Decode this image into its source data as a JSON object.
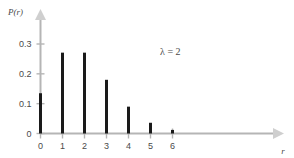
{
  "chart_data": {
    "type": "bar",
    "title": "",
    "subtitle": "",
    "xlabel": "r",
    "ylabel": "P(r)",
    "categories": [
      "0",
      "1",
      "2",
      "3",
      "4",
      "5",
      "6"
    ],
    "x": [
      0,
      1,
      2,
      3,
      4,
      5,
      6
    ],
    "values": [
      0.135,
      0.271,
      0.271,
      0.18,
      0.09,
      0.036,
      0.012
    ],
    "xlim": [
      -0.5,
      9.2
    ],
    "ylim": [
      0,
      0.345
    ],
    "xticks": [
      0,
      1,
      2,
      3,
      4,
      5,
      6
    ],
    "xtick_labels": [
      "0",
      "1",
      "2",
      "3",
      "4",
      "5",
      "6"
    ],
    "yticks": [
      0,
      0.1,
      0.2,
      0.3
    ],
    "ytick_labels": [
      "0",
      "0.1",
      "0.2",
      "0.3"
    ],
    "grid": false,
    "legend": null,
    "annotations": [
      {
        "text": "λ = 2",
        "x": 5.9,
        "y": 0.262
      }
    ],
    "bar_color": "#1a1a1a",
    "axis_color": "#b5b5b5",
    "text_color": "#4a4a4a",
    "background_color": "#ffffff",
    "bar_width_px": 3,
    "axis_arrows": true
  },
  "axis_labels": {
    "y_axis_title": "P(r)",
    "x_axis_title": "r"
  }
}
